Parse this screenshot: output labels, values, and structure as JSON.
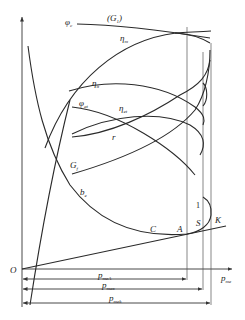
{
  "figure": {
    "axis": {
      "origin_label": "O",
      "x_label": "p",
      "x_label_sub": "me"
    },
    "curve_labels": {
      "phi_c": {
        "main": "φ",
        "sub": "c"
      },
      "G1": "(G",
      "G1_sub": "1",
      "G1_close": ")",
      "eta_m": {
        "main": "η",
        "sub": "m"
      },
      "eta_i": {
        "main": "η",
        "sub": "it"
      },
      "phi_at": {
        "main": "φ",
        "sub": "at"
      },
      "eta_et": {
        "main": "η",
        "sub": "et"
      },
      "r": "r",
      "G_f": {
        "main": "G",
        "sub": "f"
      },
      "b_e": {
        "main": "b",
        "sub": "e"
      }
    },
    "points": {
      "C": "C",
      "A": "A",
      "S": "S",
      "K": "K",
      "one": "1"
    },
    "dimensions": [
      {
        "main": "p",
        "sub": "meA"
      },
      {
        "main": "p",
        "sub": "max"
      },
      {
        "main": "p",
        "sub": "mek"
      }
    ],
    "colors": {
      "line": "#2a2a2a",
      "background": "#ffffff"
    }
  }
}
